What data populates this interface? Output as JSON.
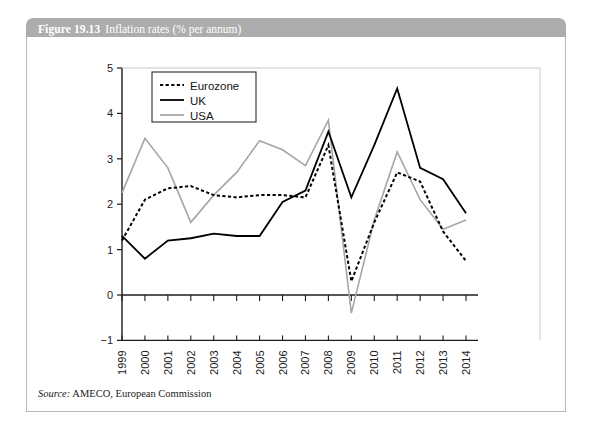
{
  "header": {
    "figure_number": "Figure 19.13",
    "figure_title": "Inflation rates (% per annum)"
  },
  "source": {
    "label": "Source:",
    "text": "AMECO, European Commission"
  },
  "colors": {
    "header_bar": "#adadad",
    "panel_border": "#b9b9b9",
    "uk_line": "#000000",
    "eurozone_line": "#000000",
    "usa_line": "#a6a6a6",
    "axis": "#1c1c1c"
  },
  "chart_data": {
    "type": "line",
    "title": "Inflation rates (% per annum)",
    "xlabel": "",
    "ylabel": "",
    "ylim": [
      -1,
      5
    ],
    "yticks": [
      -1,
      0,
      1,
      2,
      3,
      4,
      5
    ],
    "ytick_labels": [
      "−1",
      "0",
      "1",
      "2",
      "3",
      "4",
      "5"
    ],
    "grid": false,
    "legend_position": "top-left",
    "categories": [
      "1999",
      "2000",
      "2001",
      "2002",
      "2003",
      "2004",
      "2005",
      "2006",
      "2007",
      "2008",
      "2009",
      "2010",
      "2011",
      "2012",
      "2013",
      "2014"
    ],
    "series": [
      {
        "name": "Eurozone",
        "style": "dashed",
        "color": "#000000",
        "values": [
          1.2,
          2.1,
          2.35,
          2.4,
          2.2,
          2.15,
          2.2,
          2.2,
          2.15,
          3.3,
          0.3,
          1.6,
          2.7,
          2.5,
          1.4,
          0.75
        ]
      },
      {
        "name": "UK",
        "style": "solid",
        "color": "#000000",
        "values": [
          1.3,
          0.8,
          1.2,
          1.25,
          1.35,
          1.3,
          1.3,
          2.05,
          2.3,
          3.6,
          2.15,
          3.3,
          4.55,
          2.8,
          2.55,
          1.8
        ]
      },
      {
        "name": "USA",
        "style": "solid",
        "color": "#a6a6a6",
        "values": [
          2.25,
          3.45,
          2.8,
          1.6,
          2.2,
          2.7,
          3.4,
          3.2,
          2.85,
          3.85,
          -0.4,
          1.65,
          3.15,
          2.1,
          1.45,
          1.65
        ]
      }
    ]
  },
  "legend": {
    "items": [
      {
        "label": "Eurozone",
        "style": "dashed",
        "color": "#000000"
      },
      {
        "label": "UK",
        "style": "solid",
        "color": "#000000"
      },
      {
        "label": "USA",
        "style": "solid",
        "color": "#a6a6a6"
      }
    ]
  }
}
